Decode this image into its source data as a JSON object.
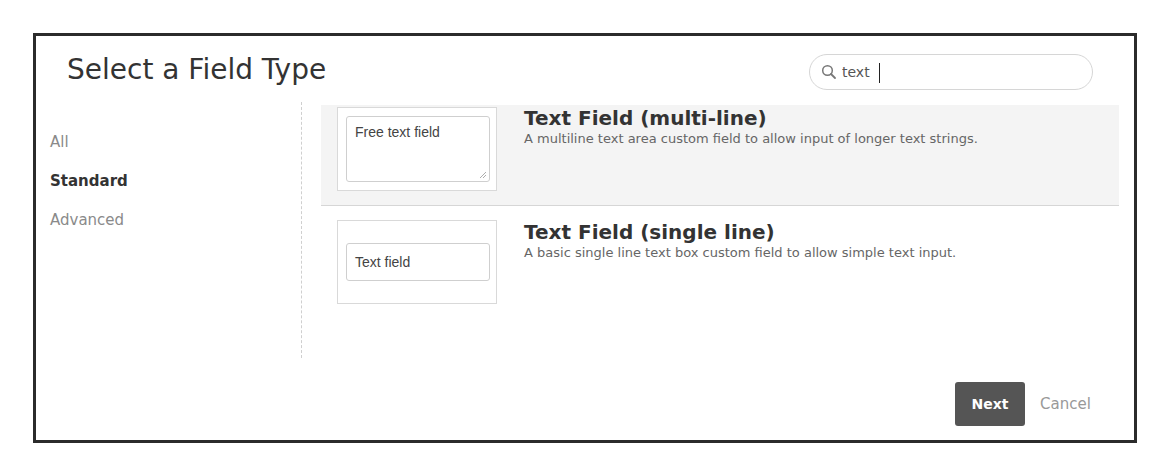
{
  "dialog": {
    "title": "Select a Field Type",
    "search": {
      "value": "text",
      "placeholder": "",
      "icon": "search-icon"
    },
    "sidebar": {
      "items": [
        {
          "label": "All",
          "active": false
        },
        {
          "label": "Standard",
          "active": true
        },
        {
          "label": "Advanced",
          "active": false
        }
      ]
    },
    "field_types": [
      {
        "name": "Text Field (multi-line)",
        "description": "A multiline text area custom field to allow input of longer text strings.",
        "preview_text": "Free text field",
        "selected": true
      },
      {
        "name": "Text Field (single line)",
        "description": "A basic single line text box custom field to allow simple text input.",
        "preview_text": "Text field",
        "selected": false
      }
    ],
    "footer": {
      "next_label": "Next",
      "cancel_label": "Cancel"
    },
    "colors": {
      "next_button_bg": "#555555",
      "selected_row_bg": "#f4f4f4",
      "frame_border": "#2b2b2b"
    }
  }
}
